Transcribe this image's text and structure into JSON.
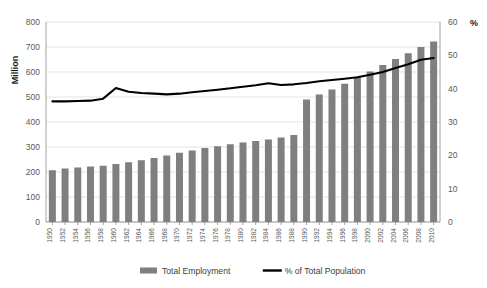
{
  "chart_data": {
    "type": "bar",
    "title": "",
    "subtitle": "",
    "xlabel": "",
    "ylabel": "Million",
    "y2label": "%",
    "ylim": [
      0,
      800
    ],
    "y2lim": [
      0,
      60
    ],
    "yticks": [
      0,
      100,
      200,
      300,
      400,
      500,
      600,
      700,
      800
    ],
    "y2ticks": [
      0,
      10,
      20,
      30,
      40,
      50,
      60
    ],
    "grid": true,
    "legend_position": "bottom",
    "categories": [
      "1950",
      "1952",
      "1954",
      "1956",
      "1958",
      "1960",
      "1962",
      "1964",
      "1966",
      "1968",
      "1970",
      "1972",
      "1974",
      "1976",
      "1978",
      "1980",
      "1982",
      "1984",
      "1986",
      "1988",
      "1990",
      "1992",
      "1994",
      "1996",
      "1998",
      "2000",
      "2002",
      "2004",
      "2006",
      "2008",
      "2010"
    ],
    "x_tick_labels": [
      "1950",
      "1954",
      "1958",
      "1962",
      "1966",
      "1970",
      "1974",
      "1978",
      "1982",
      "1986",
      "1990",
      "1994",
      "1998",
      "2002",
      "2006",
      "2010"
    ],
    "series": [
      {
        "name": "Total Employment",
        "type": "bar",
        "axis": "left",
        "unit": "Million",
        "color": "#7f7f7f",
        "values": [
          207,
          214,
          218,
          222,
          225,
          232,
          239,
          247,
          256,
          266,
          277,
          286,
          296,
          303,
          311,
          318,
          324,
          330,
          338,
          348,
          490,
          510,
          530,
          553,
          578,
          602,
          628,
          652,
          675,
          700,
          722
        ]
      },
      {
        "name": "% of Total Population",
        "type": "line",
        "axis": "right",
        "unit": "%",
        "color": "#000000",
        "values": [
          36.2,
          36.2,
          36.3,
          36.4,
          37.0,
          40.2,
          39.1,
          38.7,
          38.5,
          38.3,
          38.5,
          38.9,
          39.3,
          39.7,
          40.1,
          40.6,
          41.0,
          41.6,
          41.1,
          41.3,
          41.7,
          42.2,
          42.6,
          43.0,
          43.4,
          44.2,
          45.0,
          46.2,
          47.3,
          48.7,
          49.2
        ],
        "note": "values shown are read against the right-hand % axis"
      }
    ],
    "annotations": []
  },
  "legend": {
    "items": [
      {
        "label": "Total Employment",
        "marker": "bar-swatch",
        "color": "#7f7f7f"
      },
      {
        "label": "% of Total Population",
        "marker": "line-swatch",
        "color": "#000000"
      }
    ]
  },
  "axes": {
    "left_title": "Million",
    "right_title": "%"
  }
}
